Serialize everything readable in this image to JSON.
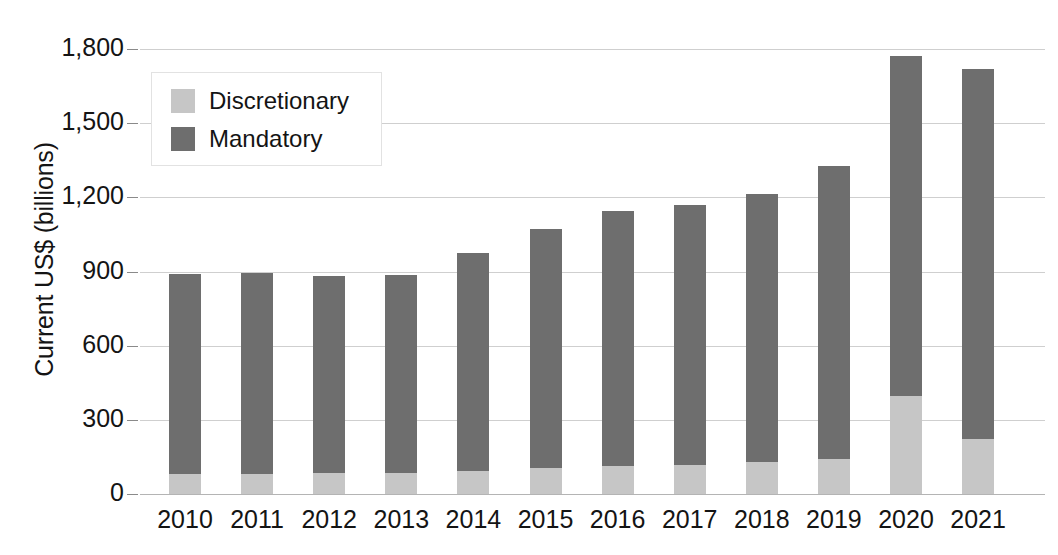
{
  "chart_data": {
    "type": "bar",
    "subtype": "stacked-vertical",
    "title": "",
    "xlabel": "",
    "ylabel": "Current US$ (billions)",
    "categories": [
      "2010",
      "2011",
      "2012",
      "2013",
      "2014",
      "2015",
      "2016",
      "2017",
      "2018",
      "2019",
      "2020",
      "2021"
    ],
    "series": [
      {
        "name": "Discretionary",
        "color": "#c6c6c6",
        "values": [
          80,
          82,
          85,
          85,
          95,
          105,
          112,
          118,
          130,
          142,
          395,
          222
        ]
      },
      {
        "name": "Mandatory",
        "color": "#6e6e6e",
        "values": [
          810,
          813,
          795,
          800,
          880,
          965,
          1033,
          1052,
          1085,
          1183,
          1375,
          1498
        ]
      }
    ],
    "totals": [
      890,
      895,
      880,
      885,
      975,
      1070,
      1145,
      1170,
      1215,
      1325,
      1770,
      1720
    ],
    "ylim": [
      0,
      1800
    ],
    "yticks": [
      0,
      300,
      600,
      900,
      1200,
      1500,
      1800
    ],
    "ytick_labels": [
      "0",
      "300",
      "600",
      "900",
      "1,200",
      "1,500",
      "1,800"
    ],
    "grid": true,
    "legend_position": "top-left",
    "stack_order": [
      "Discretionary",
      "Mandatory"
    ]
  },
  "legend": {
    "entries": [
      {
        "label": "Discretionary",
        "color": "#c6c6c6"
      },
      {
        "label": "Mandatory",
        "color": "#6e6e6e"
      }
    ]
  },
  "axes": {
    "y_title": "Current US$ (billions)"
  }
}
